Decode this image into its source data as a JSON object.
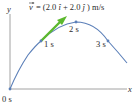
{
  "diagram": {
    "type": "projectile-trajectory",
    "equation": "v⃗ = (2.0î + 2.0ĵ) m/s",
    "equation_parts": {
      "vector_symbol": "v",
      "equals": "= (2.0",
      "i_hat": "î",
      "plus": " + 2.0",
      "j_hat": "ĵ",
      "units": ") m/s"
    },
    "axes": {
      "x_label": "x",
      "y_label": "y"
    },
    "points": [
      {
        "label": "0 s",
        "x": 10,
        "y": 89
      },
      {
        "label": "1 s",
        "x": 41,
        "y": 41
      },
      {
        "label": "2 s",
        "x": 76,
        "y": 22
      },
      {
        "label": "3 s",
        "x": 108,
        "y": 41
      }
    ],
    "velocity_arrow": {
      "from": [
        41,
        41
      ],
      "to": [
        66,
        17
      ],
      "color": "#5cb82e"
    },
    "colors": {
      "trajectory": "#5b7fb8",
      "axes": "#8a8a8a",
      "text": "#2b2b2b",
      "arrow": "#5cb82e"
    }
  }
}
